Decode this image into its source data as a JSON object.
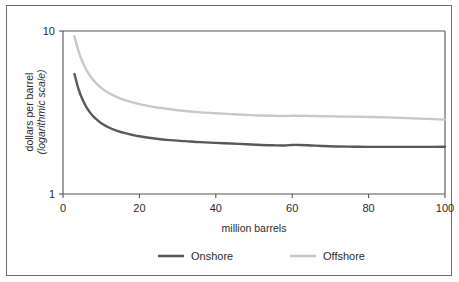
{
  "chart_data": {
    "type": "line",
    "title": "",
    "xlabel": "million barrels",
    "ylabel_line1": "dollars per barrel",
    "ylabel_line2": "(logarithmic scale)",
    "yscale": "log",
    "xscale": "linear",
    "xlim": [
      0,
      100
    ],
    "ylim": [
      1,
      10
    ],
    "xticks": [
      0,
      20,
      40,
      60,
      80,
      100
    ],
    "xtick_labels": [
      "0",
      "20",
      "40",
      "60",
      "80",
      "100"
    ],
    "yticks": [
      1,
      10
    ],
    "ytick_labels": [
      "1",
      "10"
    ],
    "grid": false,
    "legend_position": "bottom-center",
    "x": [
      3,
      4,
      5,
      6,
      7,
      8,
      9,
      10,
      12,
      14,
      16,
      18,
      20,
      24,
      28,
      32,
      36,
      40,
      44,
      48,
      52,
      55,
      58,
      60,
      62,
      65,
      68,
      72,
      76,
      80,
      85,
      90,
      95,
      100
    ],
    "series": [
      {
        "name": "Onshore",
        "color": "#595959",
        "values": [
          5.45,
          4.45,
          3.85,
          3.45,
          3.18,
          2.98,
          2.84,
          2.72,
          2.56,
          2.45,
          2.37,
          2.31,
          2.26,
          2.19,
          2.14,
          2.11,
          2.08,
          2.06,
          2.04,
          2.02,
          2.0,
          1.99,
          1.985,
          2.0,
          2.0,
          1.985,
          1.97,
          1.955,
          1.95,
          1.945,
          1.945,
          1.945,
          1.945,
          1.95
        ]
      },
      {
        "name": "Offshore",
        "color": "#c8c8c8",
        "values": [
          9.3,
          7.6,
          6.55,
          5.85,
          5.35,
          4.98,
          4.7,
          4.48,
          4.16,
          3.94,
          3.78,
          3.66,
          3.56,
          3.41,
          3.31,
          3.23,
          3.17,
          3.13,
          3.09,
          3.06,
          3.03,
          3.02,
          3.01,
          3.02,
          3.02,
          3.01,
          3.0,
          2.99,
          2.98,
          2.97,
          2.95,
          2.92,
          2.89,
          2.86
        ]
      }
    ]
  },
  "legend": {
    "items": [
      {
        "label": "Onshore",
        "color": "#595959"
      },
      {
        "label": "Offshore",
        "color": "#c8c8c8"
      }
    ]
  },
  "colors": {
    "onshore": "#595959",
    "offshore": "#c8c8c8",
    "axis": "#555555",
    "frame": "#6e6e6e",
    "text": "#2b2b2b",
    "background": "#ffffff"
  }
}
